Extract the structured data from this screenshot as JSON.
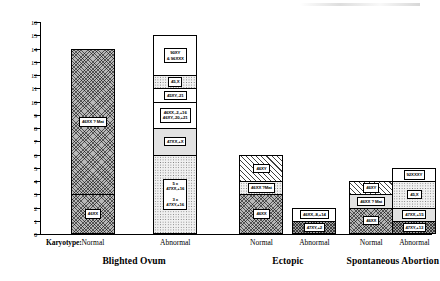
{
  "chart_data": {
    "type": "bar",
    "title": "",
    "xlabel": "Karyotype",
    "ylabel": "",
    "ylim": [
      0,
      16
    ],
    "ytick_step": 1,
    "grid": false,
    "legend": "none",
    "stacked": true,
    "axis_prefix_label": "Karyotype:",
    "ytick_labels": [
      "0",
      "1",
      "2",
      "3",
      "4",
      "5",
      "6",
      "7",
      "8",
      "9",
      "10",
      "11",
      "12",
      "13",
      "14",
      "15",
      "16"
    ],
    "groups": [
      {
        "name": "Blighted Ovum",
        "bars": [
          {
            "category": "Normal",
            "total": 14,
            "segments": [
              {
                "value": 3,
                "label": "46XX",
                "fill": "cross"
              },
              {
                "value": 11,
                "label": "46XX ? Mat",
                "fill": "cross"
              }
            ]
          },
          {
            "category": "Abnormal",
            "total": 15,
            "segments": [
              {
                "value": 6,
                "label": "5 x\n47XX,+16\n\n3 x\n47XY,+16",
                "fill": "dots"
              },
              {
                "value": 2,
                "label": "47XX,+X",
                "fill": "fine"
              },
              {
                "value": 2,
                "label": "46XX,-2,+16\n46XY,-20,+21",
                "fill": "white"
              },
              {
                "value": 1,
                "label": "45XY,-21",
                "fill": "white"
              },
              {
                "value": 1,
                "label": "45,X",
                "fill": "dots"
              },
              {
                "value": 3,
                "label": "90XY\n& 96XXX",
                "fill": "white"
              }
            ]
          }
        ]
      },
      {
        "name": "Ectopic",
        "bars": [
          {
            "category": "Normal",
            "total": 6,
            "segments": [
              {
                "value": 3,
                "label": "46XX",
                "fill": "cross"
              },
              {
                "value": 1,
                "label": "46XX ?Mat",
                "fill": "dots"
              },
              {
                "value": 2,
                "label": "46XY",
                "fill": "hatch"
              }
            ]
          },
          {
            "category": "Abnormal",
            "total": 2,
            "segments": [
              {
                "value": 1,
                "label": "47XY,+2",
                "fill": "dense"
              },
              {
                "value": 1,
                "label": "46XX,-8,+14",
                "fill": "white"
              }
            ]
          }
        ]
      },
      {
        "name": "Spontaneous Abortion",
        "bars": [
          {
            "category": "Normal",
            "total": 4,
            "segments": [
              {
                "value": 2,
                "label": "46XX",
                "fill": "cross"
              },
              {
                "value": 1,
                "label": "46XX ? Mat",
                "fill": "fine"
              },
              {
                "value": 1,
                "label": "46XY",
                "fill": "hatch"
              }
            ]
          },
          {
            "category": "Abnormal",
            "total": 5,
            "segments": [
              {
                "value": 1,
                "label": "47XY,+13",
                "fill": "dense"
              },
              {
                "value": 1,
                "label": "47XX,+15",
                "fill": "fine"
              },
              {
                "value": 2,
                "label": "45,X",
                "fill": "dots"
              },
              {
                "value": 1,
                "label": "92XXXY",
                "fill": "white"
              }
            ]
          }
        ]
      }
    ]
  },
  "axis": {
    "karyotype_prefix": "Karyotype:"
  }
}
